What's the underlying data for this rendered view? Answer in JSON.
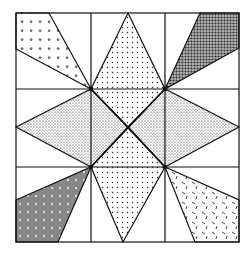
{
  "figure": {
    "frame": {
      "x": 16,
      "y": 13,
      "width": 223,
      "height": 229
    },
    "grid": {
      "xs": [
        16,
        91,
        165,
        239
      ],
      "ys": [
        13,
        89,
        167,
        242
      ]
    },
    "center": [
      128,
      127
    ],
    "pieces": [
      {
        "name": "corner-top-left",
        "pattern": "small-triangles",
        "points": "16,13 49,13 91,89 16,49"
      },
      {
        "name": "corner-top-right",
        "pattern": "dark-speckle",
        "points": "200,13 239,13 239,48 165,89"
      },
      {
        "name": "corner-bottom-left",
        "pattern": "hatch-dots",
        "points": "16,200 91,167 58,242 16,242"
      },
      {
        "name": "corner-bottom-right",
        "pattern": "dashes",
        "points": "165,167 239,200 239,242 195,242"
      },
      {
        "name": "diamond-top",
        "pattern": "light-dots",
        "points": "128,13 165,89 128,127 91,89"
      },
      {
        "name": "diamond-bottom",
        "pattern": "light-dots",
        "points": "91,167 128,127 165,167 123,242"
      },
      {
        "name": "diamond-left",
        "pattern": "speckle",
        "points": "16,127 91,89 128,127 91,167"
      },
      {
        "name": "diamond-right",
        "pattern": "speckle",
        "points": "239,127 165,89 128,127 165,167"
      }
    ],
    "colors": {
      "line": "#111111",
      "background": "#ffffff"
    }
  },
  "caption": ""
}
